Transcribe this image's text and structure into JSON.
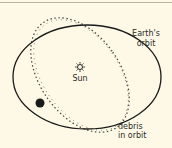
{
  "diagram": {
    "labels": {
      "sun": "Sun",
      "earth_orbit_line1": "Earth's",
      "earth_orbit_line2": "orbit",
      "debris_line1": "debris",
      "debris_line2": "in orbit"
    },
    "colors": {
      "background": "#fdf9e6",
      "line": "#1a1a1a"
    }
  }
}
